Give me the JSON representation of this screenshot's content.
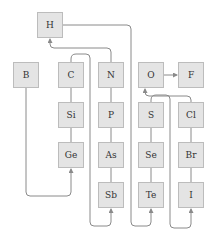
{
  "diagram": {
    "type": "element-relationship-diagram",
    "colors": {
      "node_fill": "#e4e4e4",
      "node_border": "#bcbcbc",
      "line": "#8a8a8a",
      "text": "#333333"
    },
    "nodes": [
      {
        "id": "H",
        "label": "H",
        "x": 37,
        "y": 12
      },
      {
        "id": "B",
        "label": "B",
        "x": 13,
        "y": 62
      },
      {
        "id": "C",
        "label": "C",
        "x": 58,
        "y": 62
      },
      {
        "id": "N",
        "label": "N",
        "x": 98,
        "y": 62
      },
      {
        "id": "O",
        "label": "O",
        "x": 138,
        "y": 62
      },
      {
        "id": "F",
        "label": "F",
        "x": 178,
        "y": 62
      },
      {
        "id": "Si",
        "label": "Si",
        "x": 58,
        "y": 102
      },
      {
        "id": "P",
        "label": "P",
        "x": 98,
        "y": 102
      },
      {
        "id": "S",
        "label": "S",
        "x": 138,
        "y": 102
      },
      {
        "id": "Cl",
        "label": "Cl",
        "x": 178,
        "y": 102
      },
      {
        "id": "Ge",
        "label": "Ge",
        "x": 58,
        "y": 142
      },
      {
        "id": "As",
        "label": "As",
        "x": 98,
        "y": 142
      },
      {
        "id": "Se",
        "label": "Se",
        "x": 138,
        "y": 142
      },
      {
        "id": "Br",
        "label": "Br",
        "x": 178,
        "y": 142
      },
      {
        "id": "Sb",
        "label": "Sb",
        "x": 98,
        "y": 182
      },
      {
        "id": "Te",
        "label": "Te",
        "x": 138,
        "y": 182
      },
      {
        "id": "I",
        "label": "I",
        "x": 178,
        "y": 182
      }
    ],
    "edges": [
      {
        "from": "C",
        "to": "Si",
        "arrow": false
      },
      {
        "from": "Si",
        "to": "Ge",
        "arrow": false
      },
      {
        "from": "N",
        "to": "P",
        "arrow": false
      },
      {
        "from": "P",
        "to": "As",
        "arrow": false
      },
      {
        "from": "As",
        "to": "Sb",
        "arrow": false
      },
      {
        "from": "S",
        "to": "Se",
        "arrow": false
      },
      {
        "from": "Se",
        "to": "Te",
        "arrow": false
      },
      {
        "from": "Cl",
        "to": "Br",
        "arrow": false
      },
      {
        "from": "Br",
        "to": "I",
        "arrow": false
      },
      {
        "from": "O",
        "to": "F",
        "arrow": true
      },
      {
        "from": "N",
        "to": "H",
        "arrow": true
      },
      {
        "from": "H",
        "to": "Te",
        "arrow": true
      },
      {
        "from": "B",
        "to": "Ge",
        "arrow": true
      },
      {
        "from": "C",
        "to": "Sb",
        "arrow": true
      },
      {
        "from": "Cl",
        "to": "O",
        "arrow": true
      },
      {
        "from": "S",
        "to": "I",
        "arrow": true
      }
    ]
  }
}
